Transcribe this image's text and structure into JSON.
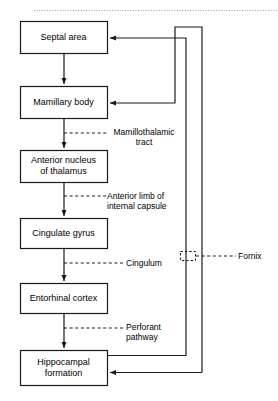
{
  "diagram": {
    "top_rule": "dotted-separator",
    "colors": {
      "line": "#1a1a1a",
      "box_fill": "#ffffff",
      "box_stroke": "#1a1a1a",
      "text": "#000000",
      "rule": "#999999"
    },
    "nodes": [
      {
        "id": "septal-area",
        "label": "Septal area",
        "x": 20,
        "y": 21,
        "w": 87,
        "h": 32
      },
      {
        "id": "mamillary-body",
        "label": "Mamillary body",
        "x": 20,
        "y": 86,
        "w": 87,
        "h": 32
      },
      {
        "id": "anterior-nucleus",
        "label": "Anterior nucleus\nof thalamus",
        "x": 20,
        "y": 150,
        "w": 87,
        "h": 32
      },
      {
        "id": "cingulate-gyrus",
        "label": "Cingulate gyrus",
        "x": 20,
        "y": 218,
        "w": 87,
        "h": 30
      },
      {
        "id": "entorhinal-cortex",
        "label": "Entorhinal cortex",
        "x": 20,
        "y": 283,
        "w": 87,
        "h": 30
      },
      {
        "id": "hippocampal-formation",
        "label": "Hippocampal\nformation",
        "x": 20,
        "y": 350,
        "w": 87,
        "h": 35
      }
    ],
    "edge_labels": [
      {
        "id": "mamillothalamic-tract",
        "text": "Mamillothalamic\ntract",
        "x": 108,
        "y": 127,
        "w": 72,
        "align": "center"
      },
      {
        "id": "anterior-limb-internal-capsule",
        "text": "Anterior limb of\ninternal capsule",
        "x": 107,
        "y": 191,
        "w": 76,
        "align": "left"
      },
      {
        "id": "cingulum",
        "text": "Cingulum",
        "x": 126,
        "y": 258,
        "w": 60,
        "align": "left"
      },
      {
        "id": "perforant-pathway",
        "text": "Perforant\npathway",
        "x": 126,
        "y": 322,
        "w": 60,
        "align": "left"
      },
      {
        "id": "fornix",
        "text": "Fornix",
        "x": 238,
        "y": 251,
        "w": 40,
        "align": "left"
      }
    ]
  }
}
